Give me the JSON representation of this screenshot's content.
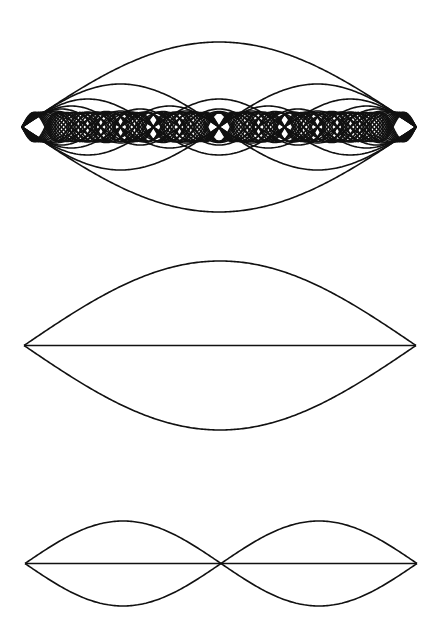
{
  "caption": {
    "text": "...partially cut off caption text..."
  },
  "diagram": {
    "stroke_color": "#111111",
    "background": "#ffffff",
    "panels": [
      {
        "name": "superposition-of-harmonics",
        "x_start": 22,
        "x_end": 416,
        "center_y": 127,
        "harmonics": [
          1,
          2,
          3,
          4,
          5,
          6,
          7,
          8,
          9,
          10,
          11,
          12,
          13,
          14,
          15,
          16,
          17
        ],
        "amplitudes": [
          85,
          43,
          28,
          21,
          18,
          16,
          15.5,
          15,
          15,
          14.5,
          14.5,
          14.5,
          14.5,
          14.5,
          14.5,
          14.5,
          14.5
        ],
        "show_axis": false
      },
      {
        "name": "fundamental-mode",
        "x_start": 24,
        "x_end": 416,
        "center_y": 345.5,
        "harmonics": [
          1
        ],
        "amplitudes": [
          84.5
        ],
        "show_axis": true
      },
      {
        "name": "second-harmonic-mode",
        "x_start": 25,
        "x_end": 417,
        "center_y": 563.5,
        "harmonics": [
          2
        ],
        "amplitudes": [
          42.5
        ],
        "show_axis": true
      }
    ]
  }
}
